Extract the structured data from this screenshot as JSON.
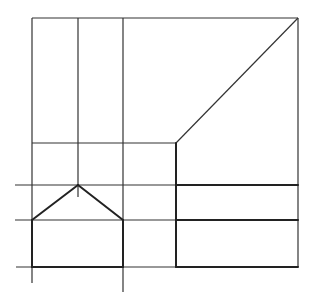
{
  "diagram": {
    "type": "orthographic-projection",
    "stroke_color": "#333333",
    "background": "#ffffff",
    "thin_lines": [
      {
        "id": "top-edge",
        "x1": 32,
        "y1": 18,
        "x2": 298,
        "y2": 18
      },
      {
        "id": "right-edge",
        "x1": 298,
        "y1": 18,
        "x2": 298,
        "y2": 267
      },
      {
        "id": "left-vertical",
        "x1": 32,
        "y1": 18,
        "x2": 32,
        "y2": 283
      },
      {
        "id": "mid-vertical",
        "x1": 78,
        "y1": 18,
        "x2": 78,
        "y2": 197
      },
      {
        "id": "right-inner-vertical",
        "x1": 123,
        "y1": 18,
        "x2": 123,
        "y2": 292
      },
      {
        "id": "diagonal",
        "x1": 298,
        "y1": 18,
        "x2": 176,
        "y2": 143
      },
      {
        "id": "horizontal-143",
        "x1": 32,
        "y1": 143,
        "x2": 176,
        "y2": 143
      },
      {
        "id": "horizontal-185",
        "x1": 15,
        "y1": 185,
        "x2": 176,
        "y2": 185
      },
      {
        "id": "horizontal-220",
        "x1": 15,
        "y1": 220,
        "x2": 176,
        "y2": 220
      },
      {
        "id": "horizontal-267",
        "x1": 16,
        "y1": 267,
        "x2": 176,
        "y2": 267
      }
    ],
    "bold_lines": [
      {
        "id": "roof-left",
        "x1": 32,
        "y1": 220,
        "x2": 78,
        "y2": 185
      },
      {
        "id": "roof-right",
        "x1": 78,
        "y1": 185,
        "x2": 123,
        "y2": 220
      },
      {
        "id": "house-left",
        "x1": 32,
        "y1": 220,
        "x2": 32,
        "y2": 267
      },
      {
        "id": "house-right",
        "x1": 123,
        "y1": 220,
        "x2": 123,
        "y2": 267
      },
      {
        "id": "house-base",
        "x1": 32,
        "y1": 267,
        "x2": 123,
        "y2": 267
      },
      {
        "id": "rect-left",
        "x1": 176,
        "y1": 143,
        "x2": 176,
        "y2": 267
      },
      {
        "id": "rect-top",
        "x1": 176,
        "y1": 185,
        "x2": 298,
        "y2": 185
      },
      {
        "id": "rect-mid",
        "x1": 176,
        "y1": 220,
        "x2": 298,
        "y2": 220
      },
      {
        "id": "rect-bottom",
        "x1": 176,
        "y1": 267,
        "x2": 298,
        "y2": 267
      }
    ]
  }
}
